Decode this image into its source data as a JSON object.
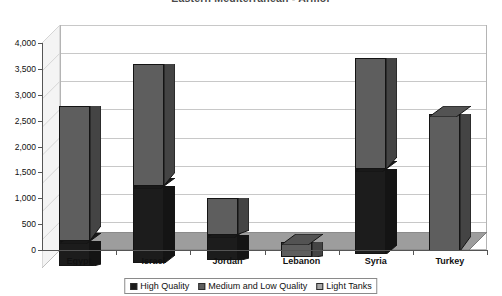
{
  "chart_data": {
    "type": "bar",
    "subtype": "stacked-3d-column",
    "title": "Eastern Mediterranean - Armor",
    "xlabel": "",
    "ylabel": "",
    "categories": [
      "Egypt",
      "Israel",
      "Jordan",
      "Lebanon",
      "Syria",
      "Turkey"
    ],
    "series": [
      {
        "name": "High Quality",
        "color": "#1c1c1c",
        "values": [
          500,
          1500,
          500,
          0,
          1650,
          0
        ]
      },
      {
        "name": "Medium and Low Quality",
        "color": "#5e5e5e",
        "values": [
          2600,
          2350,
          700,
          300,
          2150,
          2650
        ]
      },
      {
        "name": "Light Tanks",
        "color": "#a8a8a8",
        "values": [
          0,
          0,
          0,
          0,
          0,
          0
        ]
      }
    ],
    "totals": [
      3100,
      3850,
      1200,
      300,
      3800,
      2650
    ],
    "ylim": [
      0,
      4000
    ],
    "yticks": [
      0,
      500,
      1000,
      1500,
      2000,
      2500,
      3000,
      3500,
      4000
    ],
    "ytick_labels": [
      "0",
      "500",
      "1,000",
      "1,500",
      "2,000",
      "2,500",
      "3,000",
      "3,500",
      "4,000"
    ],
    "grid": true,
    "legend_position": "bottom",
    "legend_entries": [
      "High Quality",
      "Medium and Low Quality",
      "Light Tanks"
    ]
  },
  "colors": {
    "high_quality": "#1c1c1c",
    "medium_low_quality": "#5e5e5e",
    "light_tanks": "#a8a8a8",
    "plot_background": "#ffffff",
    "floor": "#9d9d9d",
    "side_wall": "#f1f1f1",
    "gridline": "#c8c8c8",
    "axis": "#555555",
    "title_text": "#4a4a4a"
  }
}
